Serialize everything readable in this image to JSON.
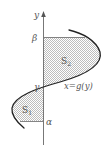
{
  "figure": {
    "labels": {
      "y_axis": "y",
      "beta": "β",
      "gamma": "γ",
      "alpha": "α",
      "curve": "x=g(y)",
      "region1": "S",
      "region1_sub": "1",
      "region2": "S",
      "region2_sub": "2"
    },
    "colors": {
      "curve": "#222222",
      "axis": "#777777",
      "shade": "#d9d9d9",
      "text": "#555555"
    }
  }
}
